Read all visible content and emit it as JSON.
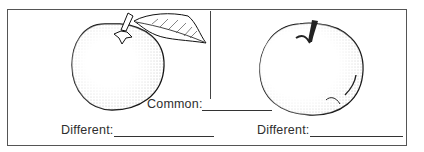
{
  "worksheet": {
    "left_item": {
      "name": "orange",
      "icon": "orange-illustration"
    },
    "right_item": {
      "name": "apple",
      "icon": "apple-illustration"
    },
    "common_label": "Common:",
    "different_left_label": "Different:",
    "different_right_label": "Different:"
  }
}
